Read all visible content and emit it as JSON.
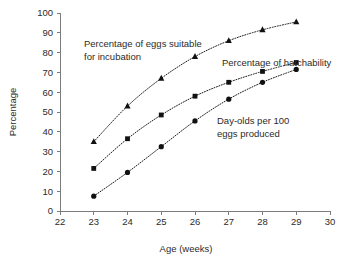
{
  "chart_data": {
    "type": "line",
    "title": "",
    "xlabel": "Age (weeks)",
    "ylabel": "Percentage",
    "xlim": [
      22,
      30
    ],
    "ylim": [
      0,
      100
    ],
    "grid": false,
    "legend_position": "inline-annotations",
    "x": [
      23,
      24,
      25,
      26,
      27,
      28,
      29
    ],
    "xticks": [
      "22",
      "23",
      "24",
      "25",
      "26",
      "27",
      "28",
      "29",
      "30"
    ],
    "yticks": [
      "0",
      "10",
      "20",
      "30",
      "40",
      "50",
      "60",
      "70",
      "80",
      "90",
      "100"
    ],
    "series": [
      {
        "name": "Percentage of eggs suitable for incubation",
        "marker": "triangle",
        "values": [
          35,
          53,
          67,
          78,
          86,
          91.5,
          95.5
        ]
      },
      {
        "name": "Percentage of hatchability",
        "marker": "square",
        "values": [
          21.5,
          36.5,
          48.5,
          58,
          65,
          70.5,
          75
        ]
      },
      {
        "name": "Day-olds per 100 eggs produced",
        "marker": "circle",
        "values": [
          7.5,
          19.5,
          32.5,
          45.5,
          56.5,
          65,
          71.5
        ]
      }
    ],
    "annotations": [
      {
        "id": "eggs-suitable",
        "line1": "Percentage of eggs suitable",
        "line2": "for incubation"
      },
      {
        "id": "hatchability",
        "line1": "Percentage of hatchability",
        "line2": ""
      },
      {
        "id": "day-olds",
        "line1": "Day-olds per 100",
        "line2": "eggs produced"
      }
    ],
    "colors": {
      "marker": "#111111",
      "line": "#1a1a1a",
      "axis": "#7c7c7c",
      "text": "#2b2b2b",
      "background": "#ffffff"
    }
  }
}
